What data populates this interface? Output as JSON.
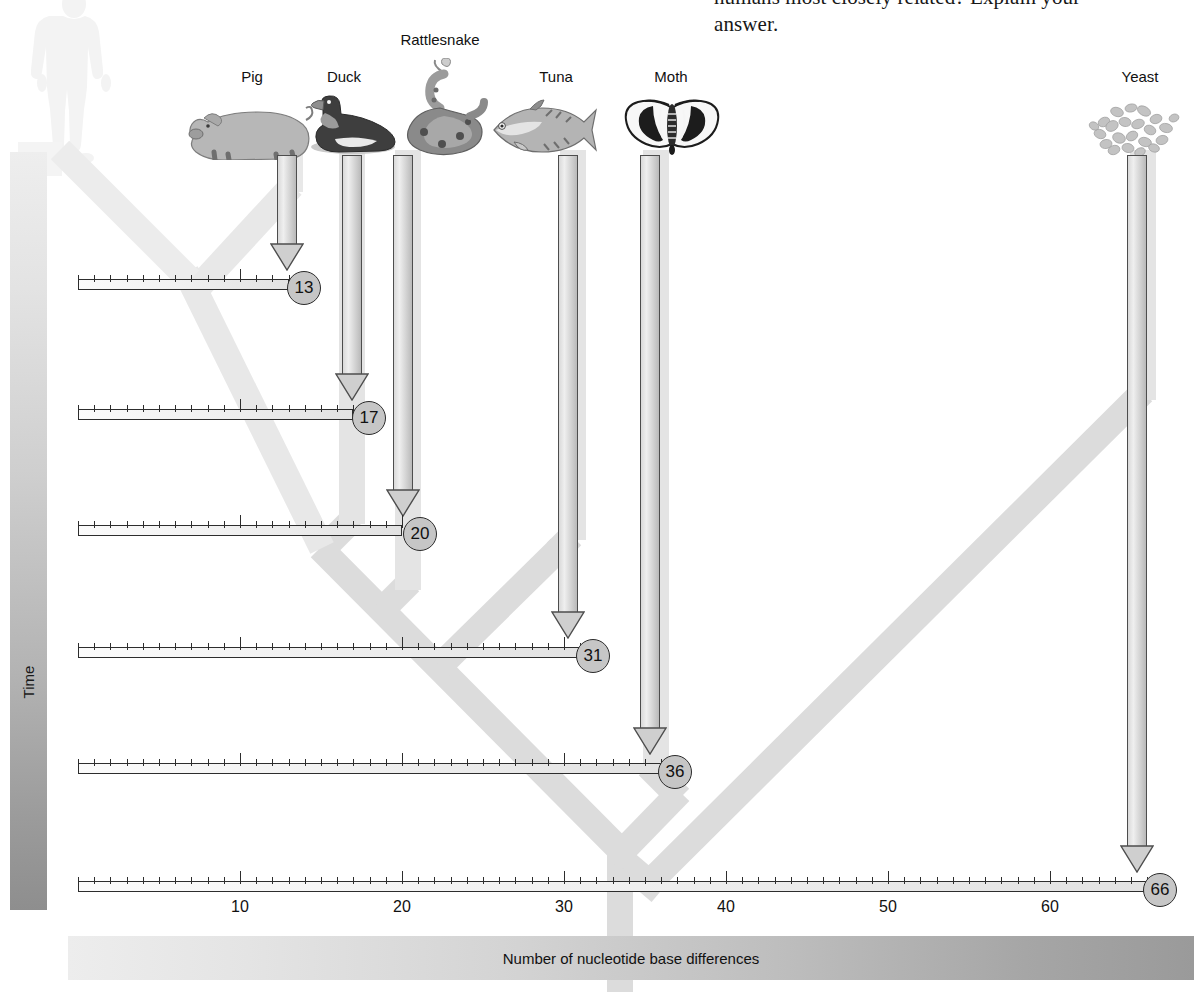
{
  "book_text": {
    "line1": "humans most closely related? Explain your",
    "line2": "answer."
  },
  "time_axis": {
    "label": "Time"
  },
  "x_axis": {
    "caption": "Number of nucleotide base differences",
    "tick_labels": [
      "10",
      "20",
      "30",
      "40",
      "50",
      "60"
    ],
    "tick_values": [
      10,
      20,
      30,
      40,
      50,
      60
    ],
    "range": [
      0,
      69
    ],
    "minor_tick_interval": 1,
    "major_tick_interval": 10
  },
  "reference_organism": {
    "name": "Human",
    "icon": "human-silhouette-icon"
  },
  "colors": {
    "branch": "#dcdcdc",
    "node_fill": "#c6c6c6",
    "node_stroke": "#2b2b2b",
    "ruler_stroke": "#2d2d2d",
    "time_bar_light": "#eeeeee",
    "time_bar_dark": "#8e8e8e",
    "background": "#ffffff"
  },
  "chart_data": {
    "type": "bar",
    "xlabel": "Number of nucleotide base differences",
    "ylabel": "Time",
    "xlim": [
      0,
      69
    ],
    "grid": false,
    "legend": "none",
    "categories": [
      "Pig",
      "Duck",
      "Rattlesnake",
      "Tuna",
      "Moth",
      "Yeast"
    ],
    "values": [
      13,
      17,
      20,
      31,
      36,
      66
    ],
    "tick_labels": [
      "10",
      "20",
      "30",
      "40",
      "50",
      "60"
    ]
  },
  "organisms": [
    {
      "name": "Pig",
      "label": "Pig",
      "value": "13",
      "icon": "pig-icon",
      "label_x": 252,
      "label_y": 68,
      "icon_x": 180,
      "icon_y": 92,
      "arrow_x": 287,
      "arrow_top": 155,
      "row": 0
    },
    {
      "name": "Duck",
      "label": "Duck",
      "value": "17",
      "icon": "duck-icon",
      "label_x": 344,
      "label_y": 68,
      "icon_x": 307,
      "icon_y": 95,
      "arrow_x": 352,
      "arrow_top": 155,
      "row": 1
    },
    {
      "name": "Rattlesnake",
      "label": "Rattlesnake",
      "value": "20",
      "icon": "rattlesnake-icon",
      "label_x": 440,
      "label_y": 31,
      "icon_x": 402,
      "icon_y": 58,
      "arrow_x": 403,
      "arrow_top": 155,
      "row": 2
    },
    {
      "name": "Tuna",
      "label": "Tuna",
      "value": "31",
      "icon": "tuna-icon",
      "label_x": 556,
      "label_y": 68,
      "icon_x": 486,
      "icon_y": 96,
      "arrow_x": 568,
      "arrow_top": 155,
      "row": 3
    },
    {
      "name": "Moth",
      "label": "Moth",
      "value": "36",
      "icon": "moth-icon",
      "label_x": 671,
      "label_y": 68,
      "icon_x": 625,
      "icon_y": 96,
      "arrow_x": 650,
      "arrow_top": 155,
      "row": 4
    },
    {
      "name": "Yeast",
      "label": "Yeast",
      "value": "66",
      "icon": "yeast-icon",
      "label_x": 1140,
      "label_y": 68,
      "icon_x": 1090,
      "icon_y": 98,
      "arrow_x": 1137,
      "arrow_top": 155,
      "row": 5
    }
  ],
  "rows": [
    {
      "value": 13,
      "y": 272
    },
    {
      "value": 17,
      "y": 402
    },
    {
      "value": 20,
      "y": 518
    },
    {
      "value": 31,
      "y": 640
    },
    {
      "value": 36,
      "y": 756
    },
    {
      "value": 66,
      "y": 874
    }
  ]
}
